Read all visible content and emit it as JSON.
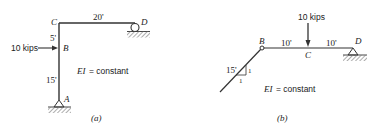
{
  "figure_a": {
    "caption": "(a)",
    "nodes": {
      "A": "A",
      "B": "B",
      "C": "C",
      "D": "D"
    },
    "dimensions": {
      "CD": "20'",
      "CB": "5'",
      "BA": "15'"
    },
    "load": {
      "label": "10 kips",
      "direction": "horizontal, to the right",
      "at": "B"
    },
    "property": "EI = constant",
    "supports": {
      "A": "pin",
      "D": "roller"
    }
  },
  "figure_b": {
    "caption": "(b)",
    "nodes": {
      "B": "B",
      "C": "C",
      "D": "D"
    },
    "dimensions": {
      "AB": "15'",
      "BC": "10'",
      "CD": "10'"
    },
    "slope": {
      "rise": "1",
      "run": "1"
    },
    "load": {
      "label": "10 kips",
      "direction": "vertical, downward",
      "at": "C"
    },
    "property": "EI = constant",
    "supports": {
      "B": "hinge",
      "D": "pin"
    }
  },
  "colors": {
    "line": "#333333",
    "hatch": "#777777"
  }
}
